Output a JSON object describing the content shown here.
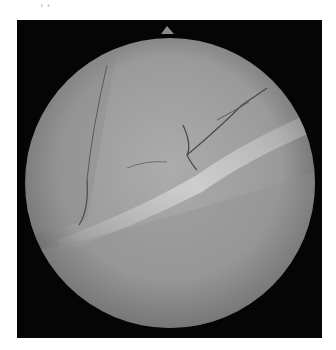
{
  "image": {
    "description": "Grayscale fundus photograph showing a retinal fold with blood vessels crossing diagonally",
    "colors": {
      "background": "#ffffff",
      "frame": "#050505",
      "fundus_center": "#a9a9a9",
      "fundus_edge": "#6e6e6e",
      "vessel": "#4a4a4a",
      "fold_highlight": "#cfcfcf"
    }
  },
  "caption_fragment": "¸   ¸"
}
